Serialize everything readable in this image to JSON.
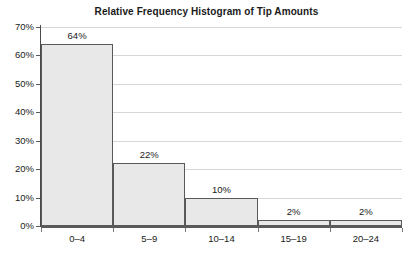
{
  "chart_data": {
    "type": "bar",
    "title": "Relative Frequency Histogram of Tip Amounts",
    "xlabel": "",
    "ylabel": "",
    "categories": [
      "0–4",
      "5–9",
      "10–14",
      "15–19",
      "20–24"
    ],
    "values": [
      64,
      22,
      10,
      2,
      2
    ],
    "data_labels": [
      "64%",
      "22%",
      "10%",
      "2%",
      "2%"
    ],
    "ylim": [
      0,
      70
    ],
    "ytick_values": [
      0,
      10,
      20,
      30,
      40,
      50,
      60,
      70
    ],
    "ytick_labels": [
      "0%",
      "10%",
      "20%",
      "30%",
      "40%",
      "50%",
      "60%",
      "70%"
    ],
    "grid": true,
    "legend": false,
    "bar_fill_color": "#e8e8e8",
    "bar_border_color": "#595959",
    "gridline_color": "#d7d7d7",
    "axis_color": "#5a5a5a",
    "background_color": "#ffffff"
  }
}
